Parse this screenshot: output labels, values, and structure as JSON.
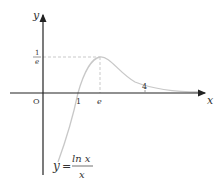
{
  "diagram": {
    "function_label": {
      "lhs": "y",
      "eq": "=",
      "numerator": "ln x",
      "denominator": "x"
    },
    "axes": {
      "x_label": "x",
      "y_label": "y",
      "origin_label": "O"
    },
    "x_ticks": [
      "1",
      "e",
      "4"
    ],
    "y_ticks": {
      "numerator": "1",
      "denominator": "e"
    },
    "colors": {
      "axis": "#222222",
      "curve": "#c8c8c8",
      "dashed": "#bbbbbb",
      "text": "#333333"
    }
  }
}
